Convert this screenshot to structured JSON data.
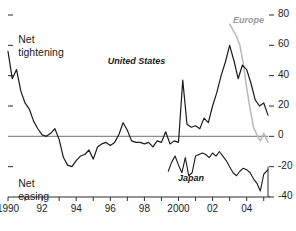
{
  "chart_data": {
    "type": "line",
    "title": "",
    "subtitle": "",
    "xlabel": "",
    "ylabel": "",
    "ylim": [
      -40,
      80
    ],
    "xlim": [
      1990,
      2005.25
    ],
    "grid": false,
    "legend_position": "inline-annotations",
    "yticks": [
      80,
      60,
      40,
      20,
      0,
      -20,
      -40
    ],
    "ytick_labels": [
      "80",
      "60",
      "40",
      "20",
      "0",
      "-20",
      "-40"
    ],
    "yaxis_side": "right",
    "zero_line": 0,
    "xticks": [
      1990,
      1991,
      1992,
      1993,
      1994,
      1995,
      1996,
      1997,
      1998,
      1999,
      2000,
      2001,
      2002,
      2003,
      2004,
      2005
    ],
    "xtick_labels": [
      "1990",
      "",
      "92",
      "",
      "94",
      "",
      "96",
      "",
      "98",
      "",
      "2000",
      "",
      "02",
      "",
      "04",
      ""
    ],
    "annotations": [
      {
        "name": "net-tightening",
        "text_line1": "Net",
        "text_line2": "tightening",
        "x": 1990.6,
        "y": 68
      },
      {
        "name": "net-easing",
        "text_line1": "Net",
        "text_line2": "easing",
        "x": 1990.6,
        "y": -27
      }
    ],
    "series": [
      {
        "name": "United States",
        "color": "#1a1a1a",
        "label_x": 1998.9,
        "label_y": 49,
        "x": [
          1990.0,
          1990.25,
          1990.5,
          1990.75,
          1991.0,
          1991.25,
          1991.5,
          1991.75,
          1992.0,
          1992.25,
          1992.5,
          1992.75,
          1993.0,
          1993.25,
          1993.5,
          1993.75,
          1994.0,
          1994.25,
          1994.5,
          1994.75,
          1995.0,
          1995.25,
          1995.5,
          1995.75,
          1996.0,
          1996.25,
          1996.5,
          1996.75,
          1997.0,
          1997.25,
          1997.5,
          1997.75,
          1998.0,
          1998.25,
          1998.5,
          1998.75,
          1999.0,
          1999.25,
          1999.5,
          1999.75,
          2000.0,
          2000.25,
          2000.5,
          2000.75,
          2001.0,
          2001.25,
          2001.5,
          2001.75,
          2002.0,
          2002.25,
          2002.5,
          2002.75,
          2003.0,
          2003.25,
          2003.5,
          2003.75,
          2004.0,
          2004.25,
          2004.5,
          2004.75,
          2005.0,
          2005.25
        ],
        "values": [
          56,
          38,
          44,
          30,
          22,
          18,
          10,
          5,
          1,
          0,
          2,
          5,
          -2,
          -14,
          -19,
          -20,
          -16,
          -13,
          -12,
          -9,
          -15,
          -7,
          -5,
          -4,
          -6,
          -4,
          1,
          9,
          4,
          -3,
          -4,
          -4,
          -5,
          -4,
          -7,
          -3,
          -4,
          3,
          -5,
          -3,
          -4,
          37,
          8,
          6,
          7,
          5,
          12,
          9,
          20,
          29,
          40,
          49,
          60,
          50,
          38,
          47,
          44,
          35,
          24,
          20,
          22,
          14
        ]
      },
      {
        "name": "Europe",
        "color": "#b8b8b8",
        "label_x": 2003.55,
        "label_y": 76,
        "x": [
          2003.0,
          2003.2,
          2003.4,
          2003.6,
          2003.8,
          2004.0,
          2004.2,
          2004.4,
          2004.6,
          2004.8,
          2005.0,
          2005.25
        ],
        "values": [
          74,
          70,
          66,
          60,
          48,
          32,
          18,
          6,
          1,
          -3,
          2,
          -4
        ]
      },
      {
        "name": "Japan",
        "color": "#1a1a1a",
        "label_x": 2000.2,
        "label_y": -28,
        "x": [
          1999.4,
          1999.6,
          1999.8,
          2000.0,
          2000.2,
          2000.4,
          2000.6,
          2000.8,
          2001.0,
          2001.2,
          2001.4,
          2001.6,
          2001.8,
          2002.0,
          2002.2,
          2002.4,
          2002.6,
          2002.8,
          2003.0,
          2003.2,
          2003.4,
          2003.6,
          2003.8,
          2004.0,
          2004.2,
          2004.4,
          2004.6,
          2004.8,
          2005.0,
          2005.25
        ],
        "values": [
          -23,
          -17,
          -13,
          -19,
          -24,
          -14,
          -26,
          -24,
          -13,
          -12,
          -11,
          -12,
          -14,
          -11,
          -13,
          -10,
          -13,
          -16,
          -20,
          -24,
          -26,
          -23,
          -21,
          -22,
          -24,
          -28,
          -31,
          -36,
          -25,
          -22
        ]
      }
    ]
  }
}
